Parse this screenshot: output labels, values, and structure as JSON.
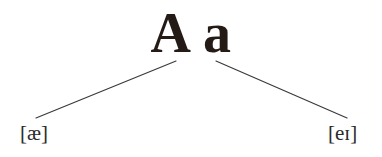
{
  "diagram": {
    "title": "A a",
    "type": "pronunciation-branch-diagram",
    "letter_node": {
      "label": "A a",
      "uppercase": "A",
      "lowercase": "a",
      "color": "#241a16"
    },
    "branches": [
      {
        "id": "branch-left",
        "label": "[æ]",
        "phoneme": "æ",
        "direction": "down-left",
        "from": {
          "x": 176,
          "y": 61
        },
        "to": {
          "x": 36,
          "y": 118
        },
        "color": "#3a3a3a"
      },
      {
        "id": "branch-right",
        "label": "[eɪ]",
        "phoneme": "eɪ",
        "direction": "down-right",
        "from": {
          "x": 216,
          "y": 61
        },
        "to": {
          "x": 347,
          "y": 118
        },
        "color": "#3a3a3a"
      }
    ],
    "ipa_left": "[æ]",
    "ipa_right": "[eɪ]",
    "background_color": "#ffffff",
    "ipa_text_color": "#2b2b2b"
  }
}
